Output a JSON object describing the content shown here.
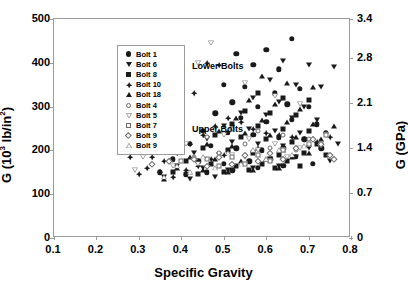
{
  "chart_data": {
    "type": "scatter",
    "title": "",
    "xlabel": "Specific Gravity",
    "ylabel": "G (10^3 lb/in^2)",
    "ylabel_right": "G (GPa)",
    "xlim": [
      0.1,
      0.8
    ],
    "ylim": [
      0,
      500
    ],
    "ylim_right": [
      0,
      3.4
    ],
    "xticks": [
      "0.1",
      "0.2",
      "0.3",
      "0.4",
      "0.5",
      "0.6",
      "0.7",
      "0.8"
    ],
    "yticks_left": [
      "0",
      "100",
      "200",
      "300",
      "400",
      "500"
    ],
    "yticks_right": [
      "0",
      "0.7",
      "1.4",
      "2.1",
      "2.8",
      "3.4"
    ],
    "grid": false,
    "legend_position": "upper-left-inside",
    "annotations": [
      {
        "text": "Lower Bolts",
        "x": 0.3,
        "y": 440
      },
      {
        "text": "Upper Bolts",
        "x": 0.3,
        "y": 295
      }
    ],
    "series": [
      {
        "name": "Bolt 1",
        "marker": "filled-circle",
        "group": "Lower Bolts",
        "points": [
          [
            0.53,
            420
          ],
          [
            0.6,
            430
          ],
          [
            0.66,
            455
          ],
          [
            0.57,
            395
          ],
          [
            0.63,
            385
          ],
          [
            0.5,
            350
          ],
          [
            0.55,
            345
          ],
          [
            0.62,
            330
          ],
          [
            0.68,
            340
          ],
          [
            0.52,
            310
          ],
          [
            0.58,
            300
          ],
          [
            0.65,
            305
          ],
          [
            0.7,
            300
          ],
          [
            0.48,
            285
          ],
          [
            0.54,
            275
          ],
          [
            0.6,
            265
          ],
          [
            0.66,
            270
          ],
          [
            0.72,
            260
          ],
          [
            0.45,
            245
          ],
          [
            0.51,
            240
          ],
          [
            0.57,
            235
          ],
          [
            0.63,
            230
          ],
          [
            0.69,
            225
          ],
          [
            0.42,
            215
          ],
          [
            0.47,
            210
          ],
          [
            0.53,
            205
          ],
          [
            0.59,
            200
          ],
          [
            0.64,
            205
          ],
          [
            0.7,
            210
          ],
          [
            0.38,
            180
          ],
          [
            0.44,
            175
          ],
          [
            0.5,
            170
          ],
          [
            0.56,
            175
          ],
          [
            0.61,
            180
          ],
          [
            0.67,
            185
          ],
          [
            0.35,
            150
          ],
          [
            0.41,
            145
          ],
          [
            0.46,
            150
          ],
          [
            0.52,
            155
          ],
          [
            0.58,
            160
          ],
          [
            0.64,
            165
          ],
          [
            0.71,
            170
          ],
          [
            0.74,
            240
          ],
          [
            0.73,
            205
          ]
        ]
      },
      {
        "name": "Bolt 6",
        "marker": "filled-down-triangle",
        "group": "Lower Bolts",
        "points": [
          [
            0.64,
            405
          ],
          [
            0.7,
            395
          ],
          [
            0.76,
            390
          ],
          [
            0.61,
            360
          ],
          [
            0.67,
            350
          ],
          [
            0.73,
            345
          ],
          [
            0.57,
            320
          ],
          [
            0.63,
            310
          ],
          [
            0.69,
            300
          ],
          [
            0.54,
            285
          ],
          [
            0.6,
            280
          ],
          [
            0.66,
            275
          ],
          [
            0.72,
            270
          ],
          [
            0.5,
            255
          ],
          [
            0.56,
            250
          ],
          [
            0.62,
            245
          ],
          [
            0.68,
            240
          ],
          [
            0.74,
            235
          ],
          [
            0.46,
            225
          ],
          [
            0.52,
            220
          ],
          [
            0.58,
            215
          ],
          [
            0.64,
            210
          ],
          [
            0.7,
            205
          ],
          [
            0.43,
            195
          ],
          [
            0.49,
            190
          ],
          [
            0.55,
            185
          ],
          [
            0.61,
            180
          ],
          [
            0.67,
            185
          ],
          [
            0.39,
            165
          ],
          [
            0.45,
            160
          ],
          [
            0.51,
            155
          ],
          [
            0.57,
            160
          ],
          [
            0.63,
            165
          ],
          [
            0.36,
            140
          ],
          [
            0.42,
            135
          ],
          [
            0.48,
            140
          ],
          [
            0.75,
            175
          ],
          [
            0.77,
            215
          ]
        ]
      },
      {
        "name": "Bolt 8",
        "marker": "filled-square",
        "group": "Lower Bolts",
        "points": [
          [
            0.58,
            330
          ],
          [
            0.64,
            320
          ],
          [
            0.7,
            315
          ],
          [
            0.55,
            290
          ],
          [
            0.61,
            285
          ],
          [
            0.67,
            280
          ],
          [
            0.52,
            260
          ],
          [
            0.58,
            255
          ],
          [
            0.64,
            250
          ],
          [
            0.7,
            245
          ],
          [
            0.48,
            235
          ],
          [
            0.54,
            230
          ],
          [
            0.6,
            225
          ],
          [
            0.66,
            220
          ],
          [
            0.72,
            215
          ],
          [
            0.45,
            205
          ],
          [
            0.51,
            200
          ],
          [
            0.57,
            195
          ],
          [
            0.63,
            190
          ],
          [
            0.69,
            195
          ],
          [
            0.41,
            175
          ],
          [
            0.47,
            170
          ],
          [
            0.53,
            165
          ],
          [
            0.59,
            170
          ],
          [
            0.65,
            175
          ],
          [
            0.38,
            150
          ],
          [
            0.44,
            145
          ],
          [
            0.5,
            150
          ],
          [
            0.56,
            155
          ],
          [
            0.62,
            160
          ],
          [
            0.68,
            165
          ],
          [
            0.74,
            190
          ]
        ]
      },
      {
        "name": "Bolt 10",
        "marker": "filled-plus-diamond",
        "group": "Lower Bolts",
        "points": [
          [
            0.46,
            400
          ],
          [
            0.49,
            395
          ],
          [
            0.43,
            330
          ],
          [
            0.4,
            300
          ],
          [
            0.37,
            270
          ],
          [
            0.34,
            245
          ],
          [
            0.31,
            225
          ],
          [
            0.29,
            205
          ],
          [
            0.33,
            185
          ],
          [
            0.36,
            175
          ],
          [
            0.39,
            195
          ],
          [
            0.42,
            215
          ],
          [
            0.45,
            235
          ],
          [
            0.48,
            255
          ],
          [
            0.51,
            275
          ],
          [
            0.54,
            265
          ],
          [
            0.57,
            250
          ],
          [
            0.6,
            240
          ],
          [
            0.63,
            235
          ],
          [
            0.66,
            230
          ],
          [
            0.69,
            225
          ],
          [
            0.32,
            160
          ],
          [
            0.35,
            150
          ],
          [
            0.38,
            140
          ],
          [
            0.41,
            155
          ],
          [
            0.44,
            165
          ],
          [
            0.47,
            180
          ],
          [
            0.5,
            190
          ],
          [
            0.28,
            185
          ],
          [
            0.3,
            145
          ],
          [
            0.72,
            220
          ],
          [
            0.75,
            230
          ]
        ]
      },
      {
        "name": "Bolt 18",
        "marker": "filled-up-triangle",
        "group": "Lower Bolts",
        "points": [
          [
            0.59,
            370
          ],
          [
            0.65,
            355
          ],
          [
            0.71,
            345
          ],
          [
            0.56,
            315
          ],
          [
            0.62,
            305
          ],
          [
            0.68,
            295
          ],
          [
            0.53,
            275
          ],
          [
            0.59,
            270
          ],
          [
            0.65,
            265
          ],
          [
            0.71,
            260
          ],
          [
            0.49,
            245
          ],
          [
            0.55,
            240
          ],
          [
            0.61,
            235
          ],
          [
            0.67,
            230
          ],
          [
            0.73,
            225
          ],
          [
            0.46,
            215
          ],
          [
            0.52,
            210
          ],
          [
            0.58,
            205
          ],
          [
            0.64,
            200
          ],
          [
            0.7,
            195
          ],
          [
            0.42,
            185
          ],
          [
            0.48,
            180
          ],
          [
            0.54,
            175
          ],
          [
            0.6,
            180
          ],
          [
            0.66,
            185
          ],
          [
            0.39,
            160
          ],
          [
            0.45,
            155
          ],
          [
            0.51,
            150
          ],
          [
            0.57,
            155
          ],
          [
            0.63,
            160
          ],
          [
            0.36,
            135
          ],
          [
            0.76,
            255
          ]
        ]
      },
      {
        "name": "Bolt 4",
        "marker": "open-circle",
        "group": "Upper Bolts",
        "points": [
          [
            0.29,
            245
          ],
          [
            0.34,
            225
          ],
          [
            0.4,
            210
          ],
          [
            0.46,
            230
          ],
          [
            0.52,
            250
          ],
          [
            0.58,
            245
          ],
          [
            0.64,
            235
          ],
          [
            0.7,
            225
          ],
          [
            0.55,
            215
          ],
          [
            0.61,
            205
          ],
          [
            0.49,
            195
          ],
          [
            0.43,
            185
          ],
          [
            0.37,
            175
          ],
          [
            0.67,
            200
          ]
        ]
      },
      {
        "name": "Bolt 5",
        "marker": "open-down-triangle",
        "group": "Upper Bolts",
        "points": [
          [
            0.47,
            445
          ],
          [
            0.44,
            400
          ],
          [
            0.55,
            355
          ],
          [
            0.62,
            325
          ],
          [
            0.68,
            305
          ],
          [
            0.41,
            215
          ],
          [
            0.35,
            195
          ],
          [
            0.31,
            185
          ],
          [
            0.5,
            235
          ],
          [
            0.56,
            225
          ],
          [
            0.62,
            215
          ],
          [
            0.68,
            205
          ],
          [
            0.73,
            215
          ],
          [
            0.38,
            165
          ],
          [
            0.44,
            170
          ],
          [
            0.52,
            190
          ],
          [
            0.58,
            200
          ],
          [
            0.29,
            155
          ],
          [
            0.65,
            185
          ]
        ]
      },
      {
        "name": "Bolt 7",
        "marker": "open-square",
        "group": "Upper Bolts",
        "points": [
          [
            0.74,
            235
          ],
          [
            0.7,
            215
          ],
          [
            0.64,
            200
          ],
          [
            0.58,
            190
          ],
          [
            0.52,
            185
          ],
          [
            0.46,
            180
          ],
          [
            0.4,
            175
          ],
          [
            0.61,
            175
          ],
          [
            0.55,
            170
          ],
          [
            0.49,
            165
          ]
        ]
      },
      {
        "name": "Bolt 9",
        "marker": "open-diamond",
        "group": "Upper Bolts",
        "points": [
          [
            0.29,
            215
          ],
          [
            0.33,
            170
          ],
          [
            0.71,
            225
          ],
          [
            0.73,
            215
          ],
          [
            0.67,
            205
          ],
          [
            0.61,
            195
          ],
          [
            0.55,
            190
          ],
          [
            0.49,
            185
          ],
          [
            0.43,
            180
          ],
          [
            0.37,
            175
          ],
          [
            0.64,
            180
          ],
          [
            0.58,
            175
          ],
          [
            0.52,
            170
          ],
          [
            0.46,
            165
          ],
          [
            0.75,
            190
          ],
          [
            0.76,
            180
          ]
        ]
      },
      {
        "name": "Bolt 9",
        "marker": "open-up-triangle",
        "group": "Upper Bolts",
        "points": [
          [
            0.36,
            140
          ],
          [
            0.42,
            150
          ],
          [
            0.48,
            160
          ],
          [
            0.54,
            170
          ],
          [
            0.6,
            180
          ],
          [
            0.66,
            190
          ],
          [
            0.57,
            200
          ],
          [
            0.51,
            195
          ],
          [
            0.45,
            185
          ],
          [
            0.39,
            165
          ],
          [
            0.63,
            200
          ],
          [
            0.69,
            210
          ]
        ]
      }
    ]
  },
  "axes": {
    "x": {
      "label_prefix": "Specific Gravity",
      "ticks": [
        "0.1",
        "0.2",
        "0.3",
        "0.4",
        "0.5",
        "0.6",
        "0.7",
        "0.8"
      ]
    },
    "y_left": {
      "label_main": "G (10",
      "label_sup": "3",
      "label_mid": " lb/in",
      "label_sup2": "2",
      "label_end": ")",
      "ticks": [
        "500",
        "400",
        "300",
        "200",
        "100",
        "0"
      ]
    },
    "y_right": {
      "label": "G (GPa)",
      "ticks": [
        "3.4",
        "2.8",
        "2.1",
        "1.4",
        "0.7",
        "0"
      ]
    }
  },
  "legend": {
    "entries": [
      {
        "label": "Bolt 1",
        "marker": "filled-circle"
      },
      {
        "label": "Bolt 6",
        "marker": "filled-down-triangle"
      },
      {
        "label": "Bolt 8",
        "marker": "filled-square"
      },
      {
        "label": "Bolt 10",
        "marker": "filled-plus-diamond"
      },
      {
        "label": "Bolt 18",
        "marker": "filled-up-triangle"
      },
      {
        "label": "Bolt 4",
        "marker": "open-circle"
      },
      {
        "label": "Bolt 5",
        "marker": "open-down-triangle"
      },
      {
        "label": "Bolt 7",
        "marker": "open-square"
      },
      {
        "label": "Bolt 9",
        "marker": "open-diamond"
      },
      {
        "label": "Bolt 9",
        "marker": "open-up-triangle"
      }
    ]
  },
  "notes": {
    "lower": "Lower Bolts",
    "upper": "Upper Bolts"
  }
}
